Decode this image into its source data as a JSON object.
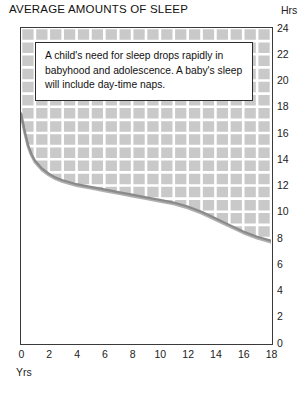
{
  "title": "AVERAGE AMOUNTS OF SLEEP",
  "axis": {
    "y_unit_label": "Hrs",
    "x_unit_label": "Yrs"
  },
  "annotation": {
    "text": "A child's need for sleep drops rapidly in babyhood and adolescence. A baby's sleep will include day-time naps."
  },
  "colors": {
    "grid_fill": "#c9c9c9",
    "grid_line": "#ffffff",
    "curve": "#8a8a8a",
    "curve_shadow": "#6e6e6e",
    "frame": "#3a3a3a",
    "plot_background": "#ffffff"
  },
  "chart_data": {
    "type": "area",
    "title": "AVERAGE AMOUNTS OF SLEEP",
    "xlabel": "Yrs",
    "ylabel": "Hrs",
    "xlim": [
      0,
      18
    ],
    "ylim": [
      0,
      24
    ],
    "xticks": [
      0,
      2,
      4,
      6,
      8,
      10,
      12,
      14,
      16,
      18
    ],
    "yticks": [
      0,
      2,
      4,
      6,
      8,
      10,
      12,
      14,
      16,
      18,
      20,
      22,
      24
    ],
    "grid": true,
    "legend": false,
    "series": [
      {
        "name": "Average hours of sleep",
        "x": [
          0,
          0.25,
          0.5,
          0.75,
          1,
          1.5,
          2,
          2.5,
          3,
          4,
          5,
          6,
          7,
          8,
          9,
          10,
          11,
          12,
          13,
          14,
          15,
          16,
          17,
          18
        ],
        "values": [
          17.5,
          16.2,
          15.1,
          14.4,
          13.9,
          13.3,
          12.9,
          12.6,
          12.4,
          12.1,
          11.9,
          11.7,
          11.5,
          11.3,
          11.1,
          10.9,
          10.7,
          10.4,
          10.0,
          9.5,
          9.0,
          8.5,
          8.1,
          7.8
        ]
      }
    ],
    "annotations": [
      {
        "text": "A child's need for sleep drops rapidly in babyhood and adolescence. A baby's sleep will include day-time naps.",
        "x": 1.2,
        "y": 22.5
      }
    ]
  }
}
